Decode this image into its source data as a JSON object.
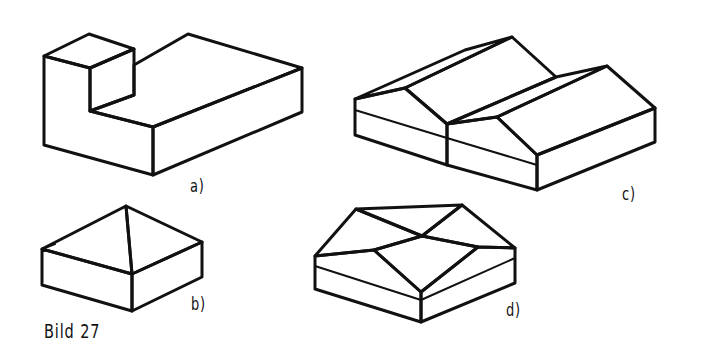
{
  "figure": {
    "caption": "Bild 27",
    "panels": [
      {
        "id": "a",
        "label": "a)",
        "description": "L-shaped building block with flat roofs"
      },
      {
        "id": "b",
        "label": "b)",
        "description": "Square building with pyramid (hip) roof"
      },
      {
        "id": "c",
        "label": "c)",
        "description": "Building with double gable (twin saddle) roof"
      },
      {
        "id": "d",
        "label": "d)",
        "description": "Square building with cross gable roof"
      }
    ]
  },
  "style": {
    "line_color": "#111111",
    "background": "#ffffff"
  }
}
